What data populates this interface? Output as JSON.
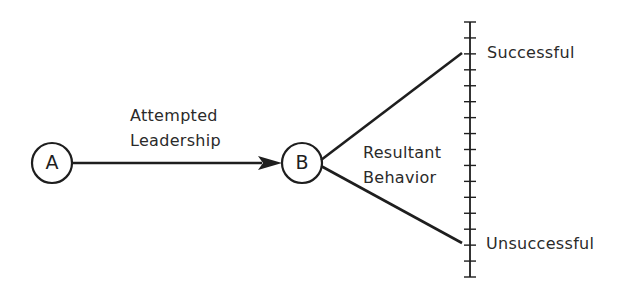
{
  "diagram": {
    "nodes": [
      {
        "id": "A",
        "label": "A",
        "cx": 52,
        "cy": 163,
        "r": 20
      },
      {
        "id": "B",
        "label": "B",
        "cx": 302,
        "cy": 163,
        "r": 20
      }
    ],
    "edges": [
      {
        "from": "A",
        "to": "B",
        "label_lines": [
          "Attempted",
          "Leadership"
        ],
        "arrow": true
      }
    ],
    "branches": {
      "label_lines": [
        "Resultant",
        "Behavior"
      ],
      "upper_end_label": "Successful",
      "lower_end_label": "Unsuccessful"
    },
    "scale": {
      "x": 470,
      "top": 22,
      "bottom": 277,
      "tick_count": 17,
      "tick_half_width": 6
    },
    "colors": {
      "ink": "#1e1e1e",
      "text": "#2a2a2a",
      "background": "#ffffff"
    }
  }
}
